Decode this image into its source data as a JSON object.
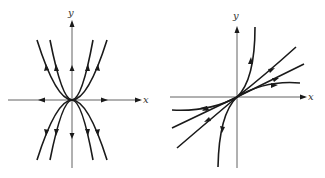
{
  "figure": {
    "panels": [
      {
        "id": "left",
        "description": "Phase portrait: node (parabolic trajectories tangent to y-axis), flow outward along x-axis and y-axis",
        "x_label": "x",
        "y_label": "y",
        "colors": {
          "curve": "#1a1a1a",
          "axis": "#3a3a3a"
        }
      },
      {
        "id": "right",
        "description": "Phase portrait: node with trajectories through origin, one straight-line solution, curves tangent to a direction",
        "x_label": "x",
        "y_label": "y",
        "colors": {
          "curve": "#1a1a1a",
          "axis": "#3a3a3a"
        }
      }
    ]
  }
}
